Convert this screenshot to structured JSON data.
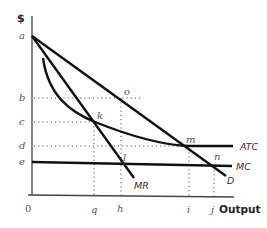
{
  "axes": {
    "y_label": "$",
    "x_label": "Output",
    "origin_label": "0",
    "y_ticks": [
      {
        "label": "a",
        "y": 36
      },
      {
        "label": "b",
        "y": 98
      },
      {
        "label": "c",
        "y": 122
      },
      {
        "label": "d",
        "y": 146
      },
      {
        "label": "e",
        "y": 162
      }
    ],
    "x_ticks": [
      {
        "label": "q",
        "x": 94
      },
      {
        "label": "h",
        "x": 120
      },
      {
        "label": "i",
        "x": 189
      },
      {
        "label": "j",
        "x": 214
      }
    ]
  },
  "curves": {
    "D": "D",
    "MR": "MR",
    "ATC": "ATC",
    "MC": "MC"
  },
  "points": {
    "o": "o",
    "k": "k",
    "m": "m",
    "n": "n",
    "l": "l"
  },
  "colors": {
    "curve": "#111111",
    "axis": "#444444",
    "guide": "#555555"
  }
}
